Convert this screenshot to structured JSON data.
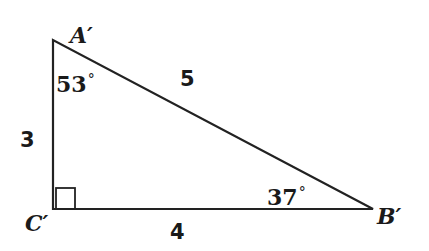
{
  "diagram": {
    "type": "right-triangle",
    "colors": {
      "stroke": "#222222",
      "text": "#1a1a1a",
      "background": "#ffffff"
    },
    "vertices": {
      "A": {
        "label": "A′",
        "x": 53,
        "y": 40
      },
      "C": {
        "label": "C′",
        "x": 53,
        "y": 209
      },
      "B": {
        "label": "B′",
        "x": 373,
        "y": 209
      }
    },
    "sides": {
      "AC": {
        "label": "3"
      },
      "CB": {
        "label": "4"
      },
      "AB": {
        "label": "5"
      }
    },
    "angles": {
      "A": {
        "value": "53",
        "unit": "°"
      },
      "B": {
        "value": "37",
        "unit": "°"
      },
      "C": {
        "marker": "right-angle-square"
      }
    }
  }
}
